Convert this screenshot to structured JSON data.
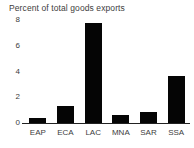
{
  "chart_data": {
    "type": "bar",
    "title": "Percent of total goods exports",
    "xlabel": "",
    "ylabel": "",
    "categories": [
      "EAP",
      "ECA",
      "LAC",
      "MNA",
      "SAR",
      "SSA"
    ],
    "values": [
      0.4,
      1.3,
      7.8,
      0.6,
      0.85,
      3.65
    ],
    "yticks": [
      0,
      2,
      4,
      6,
      8
    ],
    "ytick_labels": [
      "0",
      "2",
      "4",
      "6",
      "8"
    ],
    "ylim": [
      0,
      8
    ],
    "grid": false,
    "legend": null,
    "bar_color": "#050505",
    "background_color": "#ffffff",
    "axis_color": "#222222",
    "text_color": "#3d3d3d"
  }
}
